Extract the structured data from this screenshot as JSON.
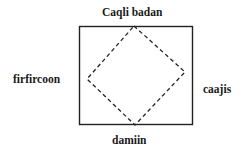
{
  "diagram": {
    "labels": {
      "top": "Caqli badan",
      "left": "firfircoon",
      "right": "caajis",
      "bottom": "damiin"
    },
    "shapes": {
      "rectangle": {
        "x": 79,
        "y": 26,
        "width": 114,
        "height": 99,
        "stroke": "#222222"
      },
      "diamond": {
        "points": "134,26 185,72 135,125 87,79",
        "stroke": "#222222",
        "dash": "4,3"
      }
    }
  }
}
